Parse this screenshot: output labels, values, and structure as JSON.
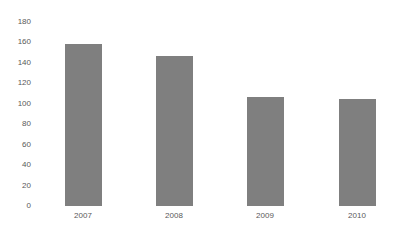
{
  "chart_data": {
    "type": "bar",
    "title": "",
    "xlabel": "",
    "ylabel": "",
    "categories": [
      "2007",
      "2008",
      "2009",
      "2010"
    ],
    "values": [
      158,
      147,
      107,
      105
    ],
    "ylim": [
      0,
      180
    ],
    "yticks": [
      "0",
      "20",
      "40",
      "60",
      "80",
      "100",
      "120",
      "140",
      "160",
      "180"
    ],
    "grid": false,
    "legend": null,
    "bar_color": "#7f7f7f"
  }
}
